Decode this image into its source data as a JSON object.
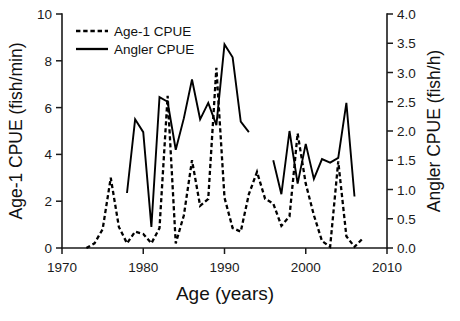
{
  "chart_data": {
    "type": "line",
    "title": "",
    "xlabel": "Age (years)",
    "ylabel": "Age-1 CPUE (fish/min)",
    "y2label": "Angler CPUE (fish/h)",
    "xlim": [
      1970,
      2010
    ],
    "ylim": [
      0,
      10
    ],
    "y2lim": [
      0.0,
      4.0
    ],
    "grid": false,
    "legend_position": "top-left",
    "xticks": [
      1970,
      1980,
      1990,
      2000,
      2010
    ],
    "xtick_labels": [
      "1970",
      "1980",
      "1990",
      "2000",
      "2010"
    ],
    "yticks": [
      0,
      2,
      4,
      6,
      8,
      10
    ],
    "ytick_labels": [
      "0",
      "2",
      "4",
      "6",
      "8",
      "10"
    ],
    "y2ticks": [
      0.0,
      0.5,
      1.0,
      1.5,
      2.0,
      2.5,
      3.0,
      3.5,
      4.0
    ],
    "y2tick_labels": [
      "0.0",
      "0.5",
      "1.0",
      "1.5",
      "2.0",
      "2.5",
      "3.0",
      "3.5",
      "4.0"
    ],
    "series": [
      {
        "name": "Age-1 CPUE",
        "axis": "left",
        "style": "dashed",
        "units": "fish/min",
        "x": [
          1973,
          1974,
          1975,
          1976,
          1977,
          1978,
          1979,
          1980,
          1981,
          1982,
          1983,
          1984,
          1985,
          1986,
          1987,
          1988,
          1989,
          1990,
          1991,
          1992,
          1993,
          1994,
          1995,
          1996,
          1997,
          1998,
          1999,
          2000,
          2001,
          2002,
          2003,
          2004,
          2005,
          2006,
          2007
        ],
        "values": [
          0.0,
          0.2,
          0.8,
          3.0,
          0.9,
          0.2,
          0.7,
          0.6,
          0.2,
          0.85,
          6.5,
          0.2,
          1.4,
          3.75,
          1.8,
          2.1,
          7.7,
          2.15,
          0.85,
          0.7,
          2.3,
          3.25,
          2.1,
          1.9,
          0.95,
          1.35,
          4.9,
          2.75,
          1.4,
          0.3,
          0.05,
          3.7,
          0.5,
          0.05,
          0.4
        ]
      },
      {
        "name": "Angler CPUE",
        "axis": "right",
        "style": "solid",
        "units": "fish/h",
        "segments": [
          {
            "x": [
              1978,
              1979,
              1980,
              1981,
              1982,
              1983,
              1984,
              1985,
              1986,
              1987,
              1988,
              1989,
              1990,
              1991,
              1992,
              1993
            ],
            "values_left_scale": [
              2.35,
              5.5,
              4.95,
              0.9,
              6.45,
              6.25,
              4.2,
              5.55,
              7.2,
              5.5,
              6.2,
              5.25,
              8.7,
              8.15,
              5.4,
              4.95
            ]
          },
          {
            "x": [
              1996,
              1997,
              1998,
              1999,
              2000,
              2001,
              2002,
              2003,
              2004,
              2005,
              2006
            ],
            "values_left_scale": [
              3.75,
              2.3,
              5.0,
              2.75,
              4.45,
              2.95,
              3.8,
              3.65,
              3.85,
              6.2,
              2.2
            ]
          }
        ]
      }
    ],
    "legend": [
      {
        "label": "Age-1 CPUE",
        "style": "dashed"
      },
      {
        "label": "Angler CPUE",
        "style": "solid"
      }
    ]
  },
  "colors": {
    "line": "#000000",
    "axis": "#1a1a1a",
    "background": "#ffffff"
  },
  "caption": {
    "text": ""
  }
}
